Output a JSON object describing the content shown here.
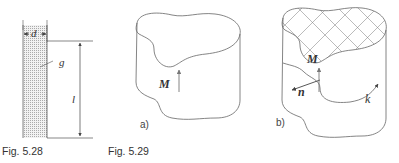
{
  "figures": [
    {
      "caption": "Fig. 5.28",
      "labels": {
        "width": "d",
        "material": "g",
        "length": "l"
      }
    },
    {
      "caption": "Fig. 5.29",
      "panels": [
        {
          "tag": "a)",
          "vector_label": "M"
        },
        {
          "tag": "b)",
          "vector_label": "M",
          "normal_label": "n",
          "current_label": "k"
        }
      ]
    }
  ],
  "colors": {
    "stroke": "#555555",
    "text": "#333333",
    "hatch": "#bbbbbb"
  }
}
